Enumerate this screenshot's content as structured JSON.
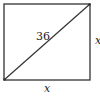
{
  "diagram": {
    "shape": "square",
    "diagonal_label": "36",
    "side_right_label": "x",
    "side_bottom_label": "x",
    "stroke_color": "#333333"
  }
}
